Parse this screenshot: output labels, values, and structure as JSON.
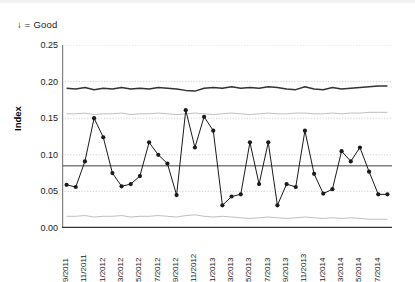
{
  "annotation": "↓ = Good",
  "axis": {
    "ylabel": "Index",
    "yticks": [
      "0.25",
      "0.20",
      "0.15",
      "0.10",
      "0.05",
      "0.00"
    ]
  },
  "colors": {
    "series": "#1a1a1a",
    "mean_line": "#808080",
    "upper_dark": "#333333",
    "limit_light": "#bfbfbf",
    "grid": "#c8c8c8",
    "axis": "#808080"
  },
  "chart_data": {
    "type": "line",
    "title": "",
    "subtitle": "",
    "xlabel": "",
    "ylabel": "Index",
    "ylim": [
      0.0,
      0.25
    ],
    "ytick_values": [
      0.25,
      0.2,
      0.15,
      0.1,
      0.05,
      0.0
    ],
    "grid": true,
    "grid_axis": "y",
    "legend": "none",
    "annotations": [
      "↓ = Good"
    ],
    "x": [
      "9/2011",
      "10/2011",
      "11/2011",
      "12/2011",
      "1/2012",
      "2/2012",
      "3/2012",
      "4/2012",
      "5/2012",
      "6/2012",
      "7/2012",
      "8/2012",
      "9/2012",
      "10/2012",
      "11/2012",
      "12/2012",
      "1/2013",
      "2/2013",
      "3/2013",
      "4/2013",
      "5/2013",
      "6/2013",
      "7/2013",
      "8/2013",
      "9/2013",
      "10/2013",
      "11/2013",
      "12/2013",
      "1/2014",
      "2/2014",
      "3/2014",
      "4/2014",
      "5/2014",
      "6/2014",
      "7/2014",
      "8/2014"
    ],
    "xtick_labels": [
      "9/2011",
      "11/2011",
      "1/2012",
      "3/2012",
      "5/2012",
      "7/2012",
      "9/2012",
      "11/2012",
      "1/2013",
      "3/2013",
      "5/2013",
      "7/2013",
      "9/2013",
      "11/2013",
      "1/2014",
      "3/2014",
      "5/2014",
      "7/2014"
    ],
    "xtick_indices": [
      0,
      2,
      4,
      6,
      8,
      10,
      12,
      14,
      16,
      18,
      20,
      22,
      24,
      26,
      28,
      30,
      32,
      34
    ],
    "series": [
      {
        "name": "Index",
        "style": "line-markers",
        "values": [
          0.059,
          0.056,
          0.091,
          0.15,
          0.124,
          0.075,
          0.057,
          0.06,
          0.071,
          0.117,
          0.1,
          0.088,
          0.045,
          0.161,
          0.11,
          0.152,
          0.133,
          0.031,
          0.043,
          0.046,
          0.117,
          0.06,
          0.117,
          0.031,
          0.06,
          0.056,
          0.133,
          0.074,
          0.047,
          0.053,
          0.105,
          0.091,
          0.11,
          0.077,
          0.046,
          0.046
        ]
      },
      {
        "name": "Upper reference",
        "style": "line",
        "values": [
          0.191,
          0.19,
          0.192,
          0.189,
          0.191,
          0.19,
          0.192,
          0.19,
          0.191,
          0.19,
          0.192,
          0.191,
          0.19,
          0.188,
          0.187,
          0.191,
          0.192,
          0.191,
          0.193,
          0.191,
          0.192,
          0.191,
          0.193,
          0.192,
          0.19,
          0.189,
          0.193,
          0.19,
          0.189,
          0.192,
          0.19,
          0.191,
          0.192,
          0.193,
          0.194,
          0.194
        ]
      },
      {
        "name": "Upper control limit",
        "style": "line-light",
        "values": [
          0.156,
          0.156,
          0.157,
          0.155,
          0.156,
          0.156,
          0.157,
          0.155,
          0.156,
          0.156,
          0.157,
          0.156,
          0.155,
          0.156,
          0.157,
          0.156,
          0.155,
          0.156,
          0.157,
          0.156,
          0.155,
          0.156,
          0.157,
          0.156,
          0.156,
          0.157,
          0.157,
          0.156,
          0.156,
          0.157,
          0.156,
          0.157,
          0.157,
          0.158,
          0.158,
          0.158
        ]
      },
      {
        "name": "Lower control limit",
        "style": "line-light",
        "values": [
          0.016,
          0.016,
          0.017,
          0.015,
          0.016,
          0.016,
          0.017,
          0.015,
          0.016,
          0.016,
          0.017,
          0.016,
          0.015,
          0.017,
          0.018,
          0.016,
          0.015,
          0.016,
          0.015,
          0.014,
          0.013,
          0.014,
          0.015,
          0.014,
          0.013,
          0.014,
          0.015,
          0.014,
          0.013,
          0.014,
          0.013,
          0.014,
          0.013,
          0.012,
          0.012,
          0.012
        ]
      }
    ],
    "mean_line": 0.085
  }
}
